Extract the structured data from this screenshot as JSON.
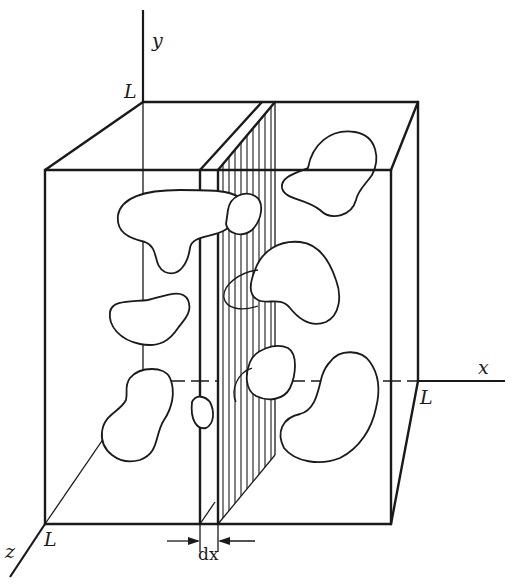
{
  "figure": {
    "axes": {
      "y_label": "y",
      "x_label": "x",
      "z_label": "z"
    },
    "corner_labels": {
      "back_top_left": "L",
      "back_bottom_right": "L",
      "front_bottom_left": "L"
    },
    "slab_label": "dx",
    "colors": {
      "ink": "#1a1a1a",
      "background": "#ffffff"
    },
    "particle_count": 9
  }
}
